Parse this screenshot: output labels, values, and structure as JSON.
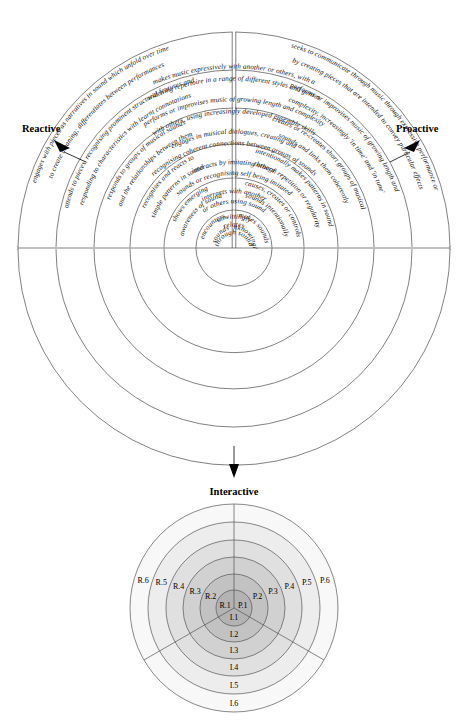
{
  "diagram": {
    "axes": {
      "reactive": "Reactive",
      "proactive": "Proactive",
      "interactive": "Interactive"
    },
    "sectors": {
      "reactive": {
        "label": "Reactive",
        "levels": [
          {
            "id": "R.1",
            "lines": [
              "encounters",
              "sounds"
            ]
          },
          {
            "id": "R.2",
            "lines": [
              "shows emerging",
              "awareness of sound"
            ]
          },
          {
            "id": "R.3",
            "lines": [
              "recognises and reacts to",
              "simple patterns in sound"
            ]
          },
          {
            "id": "R.4",
            "lines": [
              "responds to groups of musical sounds",
              "and the relationships between them"
            ]
          },
          {
            "id": "R.5",
            "lines": [
              "attends to pieces, recognising prominent structural features and",
              "responding to characteristics with learnt connotations"
            ]
          },
          {
            "id": "R.6",
            "lines": [
              "engages with pieces as narratives in sound which unfold over time",
              "to create meaning; differentiates between performances"
            ]
          }
        ]
      },
      "proactive": {
        "label": "Proactive",
        "levels": [
          {
            "id": "P.1",
            "lines": [
              "makes sounds",
              "unknowingly"
            ]
          },
          {
            "id": "P.2",
            "lines": [
              "causes, creates or controls",
              "sounds intentionally"
            ]
          },
          {
            "id": "P.3",
            "lines": [
              "intentionally makes patterns in sound",
              "through repetition or regularity"
            ]
          },
          {
            "id": "P.4",
            "lines": [
              "creates or re-creates short groups of musical",
              "sounds and links them coherently"
            ]
          },
          {
            "id": "P.5",
            "lines": [
              "performs or improvises music of growing length and",
              "complexity, increasingly 'in time' and 'in tune'"
            ]
          },
          {
            "id": "P.6",
            "lines": [
              "seeks to communicate through music through expressive performance or",
              "by creating pieces that are intended to convey particular effects"
            ]
          }
        ]
      },
      "interactive": {
        "label": "Interactive",
        "levels": [
          {
            "id": "I.1",
            "lines": [
              "unwittingly",
              "relates",
              "through sound"
            ]
          },
          {
            "id": "I.2",
            "lines": [
              "interacts with another",
              "or others using sound"
            ]
          },
          {
            "id": "I.3",
            "lines": [
              "interacts by imitating others'",
              "sounds or recognising self being imitated"
            ]
          },
          {
            "id": "I.4",
            "lines": [
              "engages in musical dialogues, creating and",
              "recognising coherent connections between groups of sounds"
            ]
          },
          {
            "id": "I.5",
            "lines": [
              "performs or improvises music of growing length and complexity",
              "with others, using increasingly developed ensemble skills"
            ]
          },
          {
            "id": "I.6",
            "lines": [
              "makes music expressively with another or others, with a",
              "widening repertoire in a range of different styles and genres"
            ]
          }
        ]
      }
    }
  },
  "legend": {
    "reactive_levels": [
      "R.1",
      "R.2",
      "R.3",
      "R.4",
      "R.5",
      "R.6"
    ],
    "proactive_levels": [
      "P.1",
      "P.2",
      "P.3",
      "P.4",
      "P.5",
      "P.6"
    ],
    "interactive_levels": [
      "I.1",
      "I.2",
      "I.3",
      "I.4",
      "I.5",
      "I.6"
    ],
    "shading": [
      "#b3b3b3",
      "#c2c2c2",
      "#d1d1d1",
      "#e0e0e0",
      "#ededed",
      "#f8f8f8"
    ]
  },
  "colors": {
    "stroke": "#4a4a4a",
    "text": "#111111",
    "background": "#ffffff"
  }
}
